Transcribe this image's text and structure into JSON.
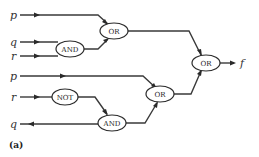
{
  "diagram": {
    "caption": "(a)",
    "inputs": {
      "p_top": "p",
      "q_top": "q",
      "r_top": "r",
      "p_bottom": "p",
      "r_bottom": "r",
      "q_bottom": "q"
    },
    "output": "f",
    "gates": {
      "and_top": "AND",
      "or_top": "OR",
      "or_final": "OR",
      "not_bottom": "NOT",
      "and_bottom": "AND",
      "or_bottom": "OR"
    }
  }
}
